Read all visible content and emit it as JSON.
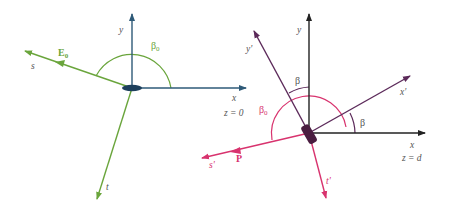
{
  "colors": {
    "blue_axis": "#2e5a78",
    "green": "#6aa53c",
    "black_axis": "#222222",
    "purple": "#5c2a5a",
    "pink": "#d8336e",
    "text_gray": "#555555",
    "optic_blue": "#1d3f5c",
    "optic_purple": "#4a1d40"
  },
  "left_frame": {
    "y_label": "y",
    "x_label": "x",
    "plane_label": "z = 0",
    "angle_label": "β",
    "angle_sub": "0",
    "field_label": "E",
    "field_sub": "0",
    "s_label": "s",
    "t_label": "t"
  },
  "right_frame": {
    "y_label": "y",
    "x_label": "x",
    "plane_label": "z = d",
    "y_prime_label": "y'",
    "x_prime_label": "x'",
    "beta_top_label": "β",
    "beta_right_label": "β",
    "angle_label": "β",
    "angle_sub": "0",
    "field_label": "P",
    "s_prime_label": "s'",
    "t_prime_label": "t'"
  }
}
